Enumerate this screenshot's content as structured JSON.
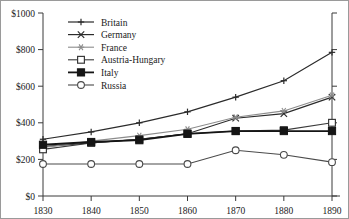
{
  "chart_data": {
    "type": "line",
    "title": "",
    "subtitle": "",
    "xlabel": "",
    "ylabel": "",
    "x": [
      1830,
      1840,
      1850,
      1860,
      1870,
      1880,
      1890
    ],
    "xtick_labels": [
      "1830",
      "1840",
      "1850",
      "1860",
      "1870",
      "1880",
      "1890"
    ],
    "ytick_values": [
      0,
      200,
      400,
      600,
      800,
      1000
    ],
    "ytick_labels": [
      "$0",
      "$200",
      "$400",
      "$600",
      "$800",
      "$1000"
    ],
    "xlim": [
      1830,
      1890
    ],
    "ylim": [
      0,
      1000
    ],
    "grid": false,
    "legend_position": "top-left-inside",
    "series": [
      {
        "name": "Britain",
        "marker": "plus",
        "color": "#2b2b2b",
        "line_width": 1.2,
        "values": [
          310,
          350,
          400,
          460,
          540,
          630,
          785
        ]
      },
      {
        "name": "Germany",
        "marker": "cross",
        "color": "#2b2b2b",
        "line_width": 1.2,
        "values": [
          270,
          290,
          310,
          340,
          425,
          450,
          540
        ]
      },
      {
        "name": "France",
        "marker": "asterisk",
        "color": "#8c8c8c",
        "line_width": 1.1,
        "values": [
          265,
          300,
          330,
          365,
          430,
          465,
          550
        ]
      },
      {
        "name": "Austria-Hungary",
        "marker": "open-square",
        "color": "#3a3a3a",
        "line_width": 1.1,
        "values": [
          255,
          290,
          310,
          340,
          355,
          360,
          400
        ]
      },
      {
        "name": "Italy",
        "marker": "filled-square",
        "color": "#151515",
        "line_width": 1.8,
        "values": [
          280,
          295,
          305,
          340,
          355,
          355,
          355
        ]
      },
      {
        "name": "Russia",
        "marker": "open-circle",
        "color": "#4a4a4a",
        "line_width": 1.1,
        "values": [
          175,
          175,
          175,
          175,
          250,
          225,
          185
        ]
      }
    ]
  },
  "legend": {
    "entries": [
      {
        "label": "Britain"
      },
      {
        "label": "Germany"
      },
      {
        "label": "France"
      },
      {
        "label": "Austria-Hungary"
      },
      {
        "label": "Italy"
      },
      {
        "label": "Russia"
      }
    ]
  }
}
